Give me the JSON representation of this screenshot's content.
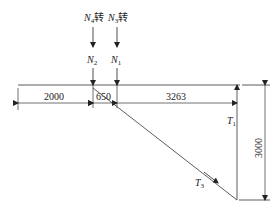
{
  "diagram": {
    "loads": [
      {
        "id": "N4",
        "label_main": "N",
        "label_sub": "4",
        "suffix": "转"
      },
      {
        "id": "N3",
        "label_main": "N",
        "label_sub": "3",
        "suffix": "转"
      }
    ],
    "forces": {
      "N2": {
        "main": "N",
        "sub": "2"
      },
      "N1": {
        "main": "N",
        "sub": "1"
      },
      "T1": {
        "main": "T",
        "sub": "1"
      },
      "T3": {
        "main": "T",
        "sub": "3"
      }
    },
    "dimensions": {
      "d1": "2000",
      "d2": "650",
      "d3": "3263",
      "height": "3000"
    }
  }
}
